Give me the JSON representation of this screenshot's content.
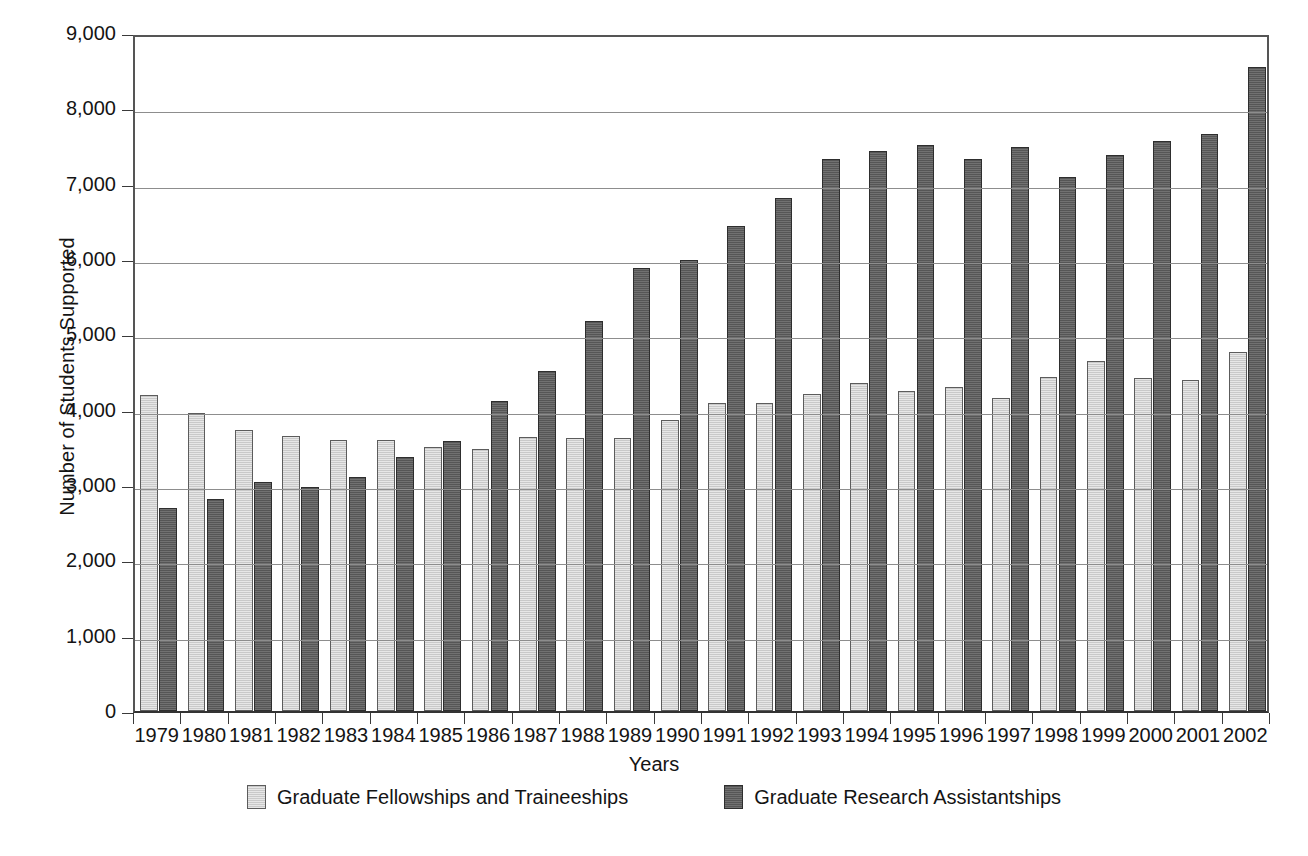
{
  "chart_data": {
    "type": "bar",
    "title": "",
    "xlabel": "Years",
    "ylabel": "Number of Students Supported",
    "ylim": [
      0,
      9000
    ],
    "ytick_step": 1000,
    "ytick_labels": [
      "9,000",
      "8,000",
      "7,000",
      "6,000",
      "5,000",
      "4,000",
      "3,000",
      "2,000",
      "1,000",
      "0"
    ],
    "ytick_values": [
      9000,
      8000,
      7000,
      6000,
      5000,
      4000,
      3000,
      2000,
      1000,
      0
    ],
    "grid": true,
    "legend_position": "bottom",
    "categories": [
      "1979",
      "1980",
      "1981",
      "1982",
      "1983",
      "1984",
      "1985",
      "1986",
      "1987",
      "1988",
      "1989",
      "1990",
      "1991",
      "1992",
      "1993",
      "1994",
      "1995",
      "1996",
      "1997",
      "1998",
      "1999",
      "2000",
      "2001",
      "2002"
    ],
    "series": [
      {
        "name": "Graduate Fellowships and Traineeships",
        "color": "#c9c9c9",
        "values": [
          4200,
          3960,
          3730,
          3650,
          3600,
          3600,
          3500,
          3480,
          3640,
          3620,
          3620,
          3860,
          4090,
          4090,
          4210,
          4360,
          4250,
          4300,
          4150,
          4440,
          4650,
          4420,
          4390,
          4760
        ]
      },
      {
        "name": "Graduate Research Assistantships",
        "color": "#565656",
        "values": [
          2700,
          2820,
          3040,
          2980,
          3100,
          3370,
          3580,
          4120,
          4520,
          5180,
          5880,
          5990,
          6440,
          6810,
          7330,
          7430,
          7510,
          7330,
          7490,
          7090,
          7380,
          7560,
          7660,
          8550
        ]
      }
    ]
  }
}
